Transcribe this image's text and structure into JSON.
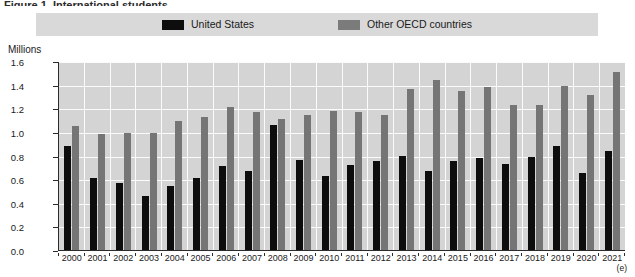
{
  "figure": {
    "caption_partial": "Figure 1. International students",
    "axis_title": "Millions",
    "estimate_note": "(e)"
  },
  "legend": {
    "entries": [
      {
        "label": "United States",
        "color": "#0d0d0d",
        "icon": "legend-swatch-icon"
      },
      {
        "label": "Other OECD countries",
        "color": "#757575",
        "icon": "legend-swatch-icon"
      }
    ]
  },
  "chart_data": {
    "type": "bar",
    "title": "",
    "xlabel": "",
    "ylabel": "Millions",
    "ylim": [
      0.0,
      1.6
    ],
    "ytick_labels": [
      "0.0",
      "0.2",
      "0.4",
      "0.6",
      "0.8",
      "1.0",
      "1.2",
      "1.4",
      "1.6"
    ],
    "ytick_values": [
      0.0,
      0.2,
      0.4,
      0.6,
      0.8,
      1.0,
      1.2,
      1.4,
      1.6
    ],
    "grid": true,
    "legend_position": "top",
    "categories": [
      "2000",
      "2001",
      "2002",
      "2003",
      "2004",
      "2005",
      "2006",
      "2007",
      "2008",
      "2009",
      "2010",
      "2011",
      "2012",
      "2013",
      "2014",
      "2015",
      "2016",
      "2017",
      "2018",
      "2019",
      "2020",
      "2021"
    ],
    "series": [
      {
        "name": "United States",
        "color": "#0d0d0d",
        "values": [
          0.88,
          0.61,
          0.57,
          0.46,
          0.54,
          0.61,
          0.71,
          0.67,
          1.06,
          0.76,
          0.63,
          0.72,
          0.75,
          0.8,
          0.67,
          0.75,
          0.78,
          0.73,
          0.79,
          0.88,
          0.65,
          0.84
        ]
      },
      {
        "name": "Other OECD countries",
        "color": "#757575",
        "values": [
          1.05,
          0.98,
          0.99,
          0.99,
          1.09,
          1.13,
          1.21,
          1.17,
          1.11,
          1.14,
          1.18,
          1.17,
          1.14,
          1.36,
          1.44,
          1.35,
          1.38,
          1.23,
          1.23,
          1.39,
          1.31,
          1.51
        ]
      }
    ]
  }
}
